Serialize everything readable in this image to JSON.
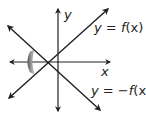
{
  "diagram": {
    "axes": {
      "x_label": "x",
      "y_label": "y"
    },
    "lines": [
      {
        "label_prefix": "y = ",
        "label_func": "f",
        "label_arg": "(x)",
        "label_full": "y = f(x)"
      },
      {
        "label_prefix": "y = −",
        "label_func": "f",
        "label_arg": "(x)",
        "label_full": "y = −f(x)"
      }
    ],
    "annotation": "reflection-arrow",
    "colors": {
      "stroke": "#231f20",
      "arrow_gradient_dark": "#555555",
      "arrow_gradient_light": "#d0d0d0"
    }
  }
}
